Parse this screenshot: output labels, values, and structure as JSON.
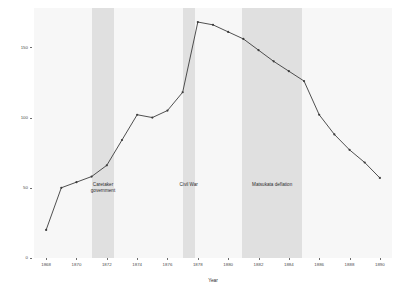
{
  "chart_data": {
    "type": "line",
    "title": "",
    "xlabel": "Year",
    "ylabel": "Total Paper Money and Bank Notes\nin ¥ millions",
    "xlim": [
      1867.2,
      1890.8
    ],
    "ylim": [
      0,
      178
    ],
    "grid": false,
    "legend_position": "none",
    "x": [
      1868,
      1869,
      1870,
      1871,
      1872,
      1873,
      1874,
      1875,
      1876,
      1877,
      1878,
      1879,
      1880,
      1881,
      1882,
      1883,
      1884,
      1885,
      1886,
      1887,
      1888,
      1889,
      1890
    ],
    "values": [
      20,
      50,
      54,
      58,
      66,
      84,
      102,
      100,
      105,
      118,
      168,
      166,
      161,
      156,
      148,
      140,
      133,
      126,
      102,
      88,
      77,
      68,
      57
    ],
    "series": [
      {
        "name": "Total Paper Money and Bank Notes",
        "color": "#3c3c3c",
        "values": [
          20,
          50,
          54,
          58,
          66,
          84,
          102,
          100,
          105,
          118,
          168,
          166,
          161,
          156,
          148,
          140,
          133,
          126,
          102,
          88,
          77,
          68,
          57
        ]
      }
    ],
    "x_ticks": [
      1868,
      1870,
      1872,
      1874,
      1876,
      1878,
      1880,
      1882,
      1884,
      1886,
      1888,
      1890
    ],
    "x_tick_labels": [
      "1868",
      "1870",
      "1872",
      "1874",
      "1876",
      "1878",
      "1880",
      "1882",
      "1884",
      "1886",
      "1888",
      "1890"
    ],
    "y_ticks": [
      0,
      50,
      100,
      150
    ],
    "y_tick_labels": [
      "0",
      "50",
      "100",
      "150"
    ],
    "annotations": [
      {
        "label": "Caretaker\ngovernment",
        "x_start": 1871.0,
        "x_end": 1872.5,
        "text_x": 1871.75,
        "text_y": 50
      },
      {
        "label": "Civil War",
        "x_start": 1877.0,
        "x_end": 1877.8,
        "text_x": 1877.4,
        "text_y": 50
      },
      {
        "label": "Matsukata deflation",
        "x_start": 1880.9,
        "x_end": 1884.9,
        "text_x": 1882.9,
        "text_y": 50
      }
    ],
    "panel_background": "#f7f7f7",
    "band_color": "#e0e0e0"
  }
}
